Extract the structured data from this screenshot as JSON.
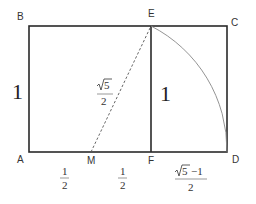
{
  "diagram": {
    "points": {
      "A": {
        "label": "A",
        "x": 29,
        "y": 152
      },
      "B": {
        "label": "B",
        "x": 29,
        "y": 26
      },
      "C": {
        "label": "C",
        "x": 227,
        "y": 26
      },
      "D": {
        "label": "D",
        "x": 227,
        "y": 152
      },
      "E": {
        "label": "E",
        "x": 151,
        "y": 26
      },
      "F": {
        "label": "F",
        "x": 151,
        "y": 152
      },
      "M": {
        "label": "M",
        "x": 91,
        "y": 152
      }
    },
    "side_labels": {
      "AB": "1",
      "EF": "1"
    },
    "fractions": {
      "AM": {
        "numerator": "1",
        "denominator": "2"
      },
      "MF": {
        "numerator": "1",
        "denominator": "2"
      },
      "ME": {
        "numerator_root": "5",
        "denominator": "2"
      },
      "FD": {
        "numerator_root": "5",
        "numerator_suffix": "−1",
        "denominator": "2"
      }
    },
    "colors": {
      "line": "#2a2a2a",
      "arc": "#888888",
      "dashed": "#555555",
      "text": "#333333",
      "background": "#ffffff"
    }
  }
}
